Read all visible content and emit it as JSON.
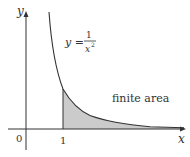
{
  "figure": {
    "axes": {
      "x_label": "x",
      "y_label": "y",
      "origin_label": "0",
      "tick_label": "1"
    },
    "curve": {
      "equation_lhs": "y =",
      "numerator": "1",
      "denominator": "x",
      "exponent": "2",
      "function": "y = 1/x^2"
    },
    "region": {
      "label": "finite area",
      "from_x": 1,
      "to_x": "infinity",
      "fill_color": "#c8c8c8"
    },
    "colors": {
      "axis": "#333333",
      "curve": "#333333",
      "shade": "#c8c8c8"
    }
  }
}
